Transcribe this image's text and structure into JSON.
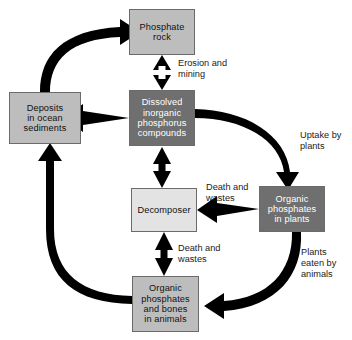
{
  "diagram": {
    "canvas": {
      "width": 352,
      "height": 340,
      "background": "#ffffff"
    },
    "palette": {
      "box_light_gray": "#bdbdbd",
      "box_pale_gray": "#e3e3e3",
      "box_dark_gray": "#6f6f6f",
      "box_border": "#6b6b6b",
      "arrow_black": "#000000",
      "text_dark": "#111111",
      "text_light": "#ffffff"
    },
    "nodes": [
      {
        "id": "phosphate_rock",
        "label": "Phosphate\nrock",
        "fill": "light"
      },
      {
        "id": "deposits",
        "label": "Deposits\nin ocean\nsediments",
        "fill": "light"
      },
      {
        "id": "dissolved",
        "label": "Dissolved\ninorganic\nphosphorus\ncompounds",
        "fill": "dark"
      },
      {
        "id": "decomposer",
        "label": "Decomposer",
        "fill": "pale"
      },
      {
        "id": "plants",
        "label": "Organic\nphosphates\nin plants",
        "fill": "dark"
      },
      {
        "id": "animals",
        "label": "Organic\nphosphates\nand bones\nin animals",
        "fill": "light"
      }
    ],
    "edge_labels": [
      {
        "id": "erosion",
        "text": "Erosion and\nmining"
      },
      {
        "id": "uptake",
        "text": "Uptake by\nplants"
      },
      {
        "id": "death_wastes_plants",
        "text": "Death and\nwastes"
      },
      {
        "id": "death_wastes_animals",
        "text": "Death and\nwastes"
      },
      {
        "id": "plants_eaten",
        "text": "Plants\neaten by\nanimals"
      }
    ],
    "edges": [
      {
        "id": "deposits-to-rock",
        "from": "deposits",
        "to": "phosphate_rock",
        "style": "curved-thick",
        "direction": "one-way"
      },
      {
        "id": "rock-dissolved",
        "from": "phosphate_rock",
        "to": "dissolved",
        "style": "straight-thick",
        "direction": "two-way",
        "label": "erosion"
      },
      {
        "id": "dissolved-to-deposits",
        "from": "dissolved",
        "to": "deposits",
        "style": "straight-thick",
        "direction": "one-way"
      },
      {
        "id": "dissolved-decomposer",
        "from": "dissolved",
        "to": "decomposer",
        "style": "straight-thick",
        "direction": "two-way"
      },
      {
        "id": "dissolved-to-plants",
        "from": "dissolved",
        "to": "plants",
        "style": "curved-thick",
        "direction": "one-way",
        "label": "uptake"
      },
      {
        "id": "plants-to-decomposer",
        "from": "plants",
        "to": "decomposer",
        "style": "straight-thick",
        "direction": "one-way",
        "label": "death_wastes_plants"
      },
      {
        "id": "animals-decomposer",
        "from": "animals",
        "to": "decomposer",
        "style": "straight-thick",
        "direction": "two-way",
        "label": "death_wastes_animals"
      },
      {
        "id": "plants-to-animals",
        "from": "plants",
        "to": "animals",
        "style": "curved-thick",
        "direction": "one-way",
        "label": "plants_eaten"
      },
      {
        "id": "animals-to-deposits",
        "from": "animals",
        "to": "deposits",
        "style": "curved-thick",
        "direction": "one-way"
      }
    ]
  }
}
